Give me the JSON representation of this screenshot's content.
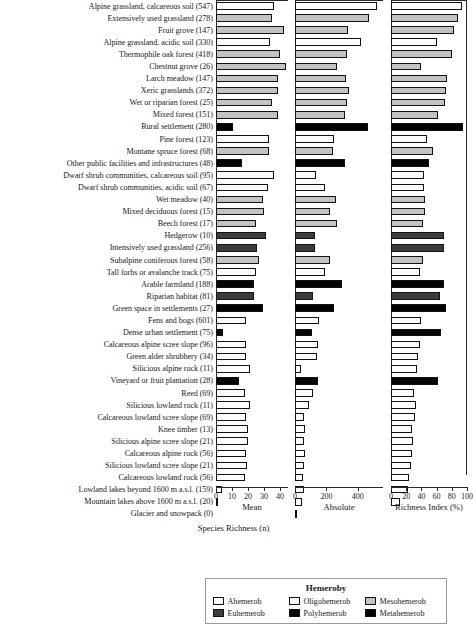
{
  "chart_data": {
    "type": "bar",
    "title": "",
    "orientation": "horizontal",
    "xlabel": "Species Richness (n)",
    "ylabel": "",
    "grid": false,
    "legend_position": "bottom",
    "panels": [
      {
        "name": "mean",
        "title": "Mean",
        "xlim": [
          0,
          45
        ],
        "ticks": [
          0,
          10,
          20,
          30,
          40
        ],
        "tick_labels": [
          "0",
          "10",
          "20",
          "30",
          "40"
        ]
      },
      {
        "name": "absolute",
        "title": "Absolute",
        "xlim": [
          0,
          560
        ],
        "ticks": [
          0,
          200,
          400
        ],
        "tick_labels": [
          "0",
          "200",
          "400"
        ]
      },
      {
        "name": "richness_index",
        "title": "Richness Index (%)",
        "xlim": [
          0,
          100
        ],
        "ticks": [
          0,
          20,
          40,
          60,
          80,
          100
        ],
        "tick_labels": [
          "0",
          "20",
          "40",
          "60",
          "80",
          "100"
        ]
      }
    ],
    "legend": {
      "title": "Hemeroby",
      "entries": [
        {
          "label": "Ahemerob",
          "key": "ahemerob",
          "color": "#ffffff"
        },
        {
          "label": "Oligohemerob",
          "key": "oligohemerob",
          "color": "#fbfbfb"
        },
        {
          "label": "Mesohemerob",
          "key": "mesohemerob",
          "color": "#c3c3c3"
        },
        {
          "label": "Euhemerob",
          "key": "euhemerob",
          "color": "#3c3c3c"
        },
        {
          "label": "Polyhemerob",
          "key": "polyhemerob",
          "color": "#000000"
        },
        {
          "label": "Metahemerob",
          "key": "metahemerob",
          "color": "#060606"
        }
      ]
    },
    "categories": [
      "Alpine grassland, calcareous soil (547)",
      "Extensively used grassland (278)",
      "Fruit grove (147)",
      "Alpine grassland, acidic soil (330)",
      "Thermophile oak forest (418)",
      "Chestnut grove (26)",
      "Larch meadow (147)",
      "Xeric grasslands (372)",
      "Wet or riparian forest (25)",
      "Mixed forest (151)",
      "Rural settlement (280)",
      "Pine forest (123)",
      "Montane spruce forest (68)",
      "Other public facilities and infrastructures (48)",
      "Dwarf shrub communities, calcareous soil (95)",
      "Dwarf shrub communities, acidic soil (67)",
      "Wet meadow (40)",
      "Mixed deciduous forest (15)",
      "Beech forest (17)",
      "Hedgerow (10)",
      "Intensively used grassland (256)",
      "Subalpine coniferous forest (58)",
      "Tall forbs or avalanche track (75)",
      "Arable farmland (188)",
      "Riparian habitat (81)",
      "Green space in settlements (27)",
      "Fens and bogs (601)",
      "Dense urban settlement (75)",
      "Calcareous alpine scree slope (96)",
      "Green alder shrubbery (34)",
      "Silicious alpine rock (11)",
      "Vineyard or fruit plantation (28)",
      "Reed (69)",
      "Silicious lowland rock (11)",
      "Calcareous lowland scree slope (69)",
      "Knee timber (13)",
      "Silicious alpine scree slope (21)",
      "Calcareous alpine rock (56)",
      "Silicious lowland scree slope (21)",
      "Calcareous lowland rock (56)",
      "Lowland lakes beyond 1600 m a.s.l. (159)",
      "Mountain lakes above 1600 m a.s.l. (20)",
      "Glacier and snowpack (0)"
    ],
    "hemeroby_class": [
      "oligohemerob",
      "mesohemerob",
      "mesohemerob",
      "oligohemerob",
      "mesohemerob",
      "mesohemerob",
      "mesohemerob",
      "mesohemerob",
      "mesohemerob",
      "mesohemerob",
      "polyhemerob",
      "oligohemerob",
      "mesohemerob",
      "polyhemerob",
      "oligohemerob",
      "oligohemerob",
      "mesohemerob",
      "mesohemerob",
      "mesohemerob",
      "euhemerob",
      "euhemerob",
      "mesohemerob",
      "oligohemerob",
      "metahemerob",
      "euhemerob",
      "polyhemerob",
      "oligohemerob",
      "metahemerob",
      "ahemerob",
      "oligohemerob",
      "ahemerob",
      "metahemerob",
      "oligohemerob",
      "ahemerob",
      "ahemerob",
      "oligohemerob",
      "ahemerob",
      "ahemerob",
      "ahemerob",
      "ahemerob",
      "oligohemerob",
      "ahemerob",
      "ahemerob"
    ],
    "series": [
      {
        "name": "Mean",
        "panel": "mean",
        "values": [
          36.0,
          35.0,
          42.5,
          33.5,
          40.0,
          43.5,
          39.0,
          38.5,
          35.0,
          38.5,
          10.5,
          33.0,
          33.0,
          16.0,
          36.5,
          32.5,
          29.5,
          30.0,
          25.0,
          31.0,
          25.5,
          27.0,
          25.0,
          24.0,
          23.5,
          29.5,
          18.5,
          4.5,
          18.5,
          19.0,
          21.5,
          14.5,
          18.0,
          21.0,
          19.0,
          20.0,
          20.0,
          18.5,
          19.5,
          18.0,
          4.0,
          1.0,
          0.0
        ]
      },
      {
        "name": "Absolute",
        "panel": "absolute",
        "values": [
          523,
          470,
          340,
          420,
          330,
          265,
          325,
          345,
          330,
          320,
          465,
          250,
          240,
          320,
          135,
          190,
          260,
          225,
          265,
          130,
          130,
          220,
          190,
          300,
          115,
          245,
          150,
          105,
          145,
          140,
          40,
          145,
          115,
          90,
          60,
          65,
          60,
          65,
          55,
          50,
          60,
          45,
          8
        ]
      },
      {
        "name": "Richness Index (%)",
        "panel": "richness_index",
        "values": [
          93,
          88,
          83,
          60,
          80,
          40,
          74,
          73,
          71,
          62,
          95,
          47,
          55,
          50,
          44,
          43,
          45,
          45,
          42,
          70,
          70,
          42,
          38,
          70,
          65,
          73,
          40,
          66,
          38,
          36,
          34,
          62,
          30,
          33,
          32,
          28,
          29,
          27,
          26,
          24,
          22,
          12,
          0
        ]
      }
    ]
  }
}
